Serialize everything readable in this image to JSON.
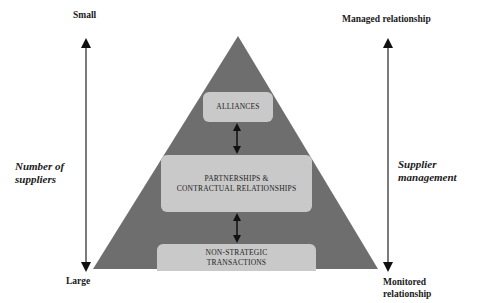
{
  "left_axis": {
    "top_label": "Small",
    "bottom_label": "Large",
    "title_line1": "Number of",
    "title_line2": "suppliers"
  },
  "right_axis": {
    "top_label": "Managed relationship",
    "bottom_label_line1": "Monitored",
    "bottom_label_line2": "relationship",
    "title_line1": "Supplier",
    "title_line2": "management"
  },
  "pyramid": {
    "fill_color": "#6e6e6e",
    "box_color": "#c9c9c9",
    "levels": [
      {
        "line1": "ALLIANCES",
        "line2": ""
      },
      {
        "line1": "PARTNERSHIPS &",
        "line2": "CONTRACTUAL RELATIONSHIPS"
      },
      {
        "line1": "NON-STRATEGIC",
        "line2": "TRANSACTIONS"
      }
    ]
  }
}
